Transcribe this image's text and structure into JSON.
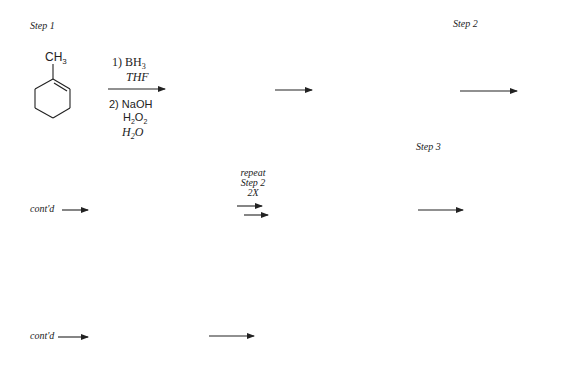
{
  "steps": {
    "step1": "Step 1",
    "step2": "Step 2",
    "step3": "Step 3"
  },
  "molecule": {
    "name": "1-methylcyclohexene",
    "substituent": "CH",
    "substituent_sub": "3"
  },
  "reagents_step1": {
    "line1_prefix": "1) BH",
    "line1_sub": "3",
    "line2": "THF",
    "line3": "2) NaOH",
    "line4_a": "H",
    "line4_sub1": "2",
    "line4_b": "O",
    "line4_sub2": "2",
    "line5_a": "H",
    "line5_sub": "2",
    "line5_b": "O"
  },
  "row2": {
    "contd": "cont'd",
    "repeat_line1": "repeat",
    "repeat_line2": "Step 2",
    "repeat_line3": "2X"
  },
  "row3": {
    "contd": "cont'd"
  },
  "colors": {
    "ink": "#222222",
    "background": "#ffffff"
  }
}
